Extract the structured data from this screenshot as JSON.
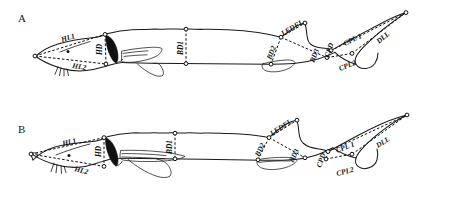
{
  "figure": {
    "background_color": "#ffffff",
    "line_color": "#1a1a1a",
    "measurement_line_color": "#111111",
    "width": 458,
    "height": 210
  },
  "panels": [
    {
      "id": "A",
      "label": "A",
      "measurements": [
        {
          "code": "HL1",
          "name": "head-length-dorsal"
        },
        {
          "code": "HL2",
          "name": "head-length-ventral"
        },
        {
          "code": "HD",
          "name": "head-depth"
        },
        {
          "code": "BD1",
          "name": "body-depth-1"
        },
        {
          "code": "BD2",
          "name": "body-depth-2"
        },
        {
          "code": "BD3",
          "name": "body-depth-3"
        },
        {
          "code": "LEDFL",
          "name": "lower-edge-dorsal-fin-length"
        },
        {
          "code": "CPD",
          "name": "caudal-peduncle-depth"
        },
        {
          "code": "CPL 1",
          "name": "caudal-peduncle-length-1"
        },
        {
          "code": "CPL2",
          "name": "caudal-peduncle-length-2"
        },
        {
          "code": "DLL",
          "name": "dorsal-lobe-length"
        }
      ]
    },
    {
      "id": "B",
      "label": "B",
      "measurements": [
        {
          "code": "HL1",
          "name": "head-length-dorsal"
        },
        {
          "code": "HL2",
          "name": "head-length-ventral"
        },
        {
          "code": "HD",
          "name": "head-depth"
        },
        {
          "code": "BD1",
          "name": "body-depth-1"
        },
        {
          "code": "BD2",
          "name": "body-depth-2"
        },
        {
          "code": "BD3",
          "name": "body-depth-3"
        },
        {
          "code": "LEDFL",
          "name": "lower-edge-dorsal-fin-length"
        },
        {
          "code": "CPD",
          "name": "caudal-peduncle-depth"
        },
        {
          "code": "CPL 1",
          "name": "caudal-peduncle-length-1"
        },
        {
          "code": "CPL2",
          "name": "caudal-peduncle-length-2"
        },
        {
          "code": "DLL",
          "name": "dorsal-lobe-length"
        }
      ]
    }
  ]
}
